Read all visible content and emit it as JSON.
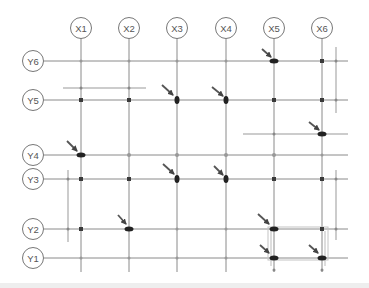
{
  "diagram": {
    "type": "structural-grid-plan",
    "colors": {
      "grid_line": "#8a8a8a",
      "bubble_stroke": "#777777",
      "node": "#3a3a3a",
      "arrow": "#555555",
      "aux_line": "#999999",
      "background": "#ffffff",
      "bottom_strip": "#eeeeee"
    },
    "x_axes": [
      {
        "label": "X1",
        "x": 81
      },
      {
        "label": "X2",
        "x": 129
      },
      {
        "label": "X3",
        "x": 177
      },
      {
        "label": "X4",
        "x": 226
      },
      {
        "label": "X5",
        "x": 274
      },
      {
        "label": "X6",
        "x": 322
      }
    ],
    "y_axes": [
      {
        "label": "Y6",
        "y": 61
      },
      {
        "label": "Y5",
        "y": 100
      },
      {
        "label": "Y4",
        "y": 155
      },
      {
        "label": "Y3",
        "y": 179
      },
      {
        "label": "Y2",
        "y": 229
      },
      {
        "label": "Y1",
        "y": 258
      }
    ],
    "highlighted_nodes": [
      {
        "at": "X5-Y6"
      },
      {
        "at": "X3-Y5"
      },
      {
        "at": "X4-Y5"
      },
      {
        "at": "X6-Y4.5"
      },
      {
        "at": "X1-Y4"
      },
      {
        "at": "X3-Y3"
      },
      {
        "at": "X4-Y3"
      },
      {
        "at": "X2-Y2"
      },
      {
        "at": "X5-Y2"
      },
      {
        "at": "X5-Y1"
      },
      {
        "at": "X6-Y1"
      }
    ]
  }
}
